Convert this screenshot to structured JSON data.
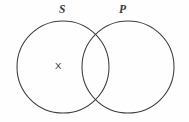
{
  "diagram": {
    "type": "venn-two-set",
    "title": "",
    "background_color": "#fefefe",
    "stroke_color": "#3d3d3d",
    "text_color": "#3a3a3a",
    "sets": [
      {
        "id": "S",
        "label": "S",
        "label_style": "italic",
        "cx": 63,
        "cy": 67,
        "r": 46
      },
      {
        "id": "P",
        "label": "P",
        "label_style": "italic",
        "cx": 128,
        "cy": 67,
        "r": 46
      }
    ],
    "marks": [
      {
        "symbol": "X",
        "region": "S-only",
        "meaning": "at-least-one-member",
        "x": 59,
        "y": 66
      }
    ]
  }
}
